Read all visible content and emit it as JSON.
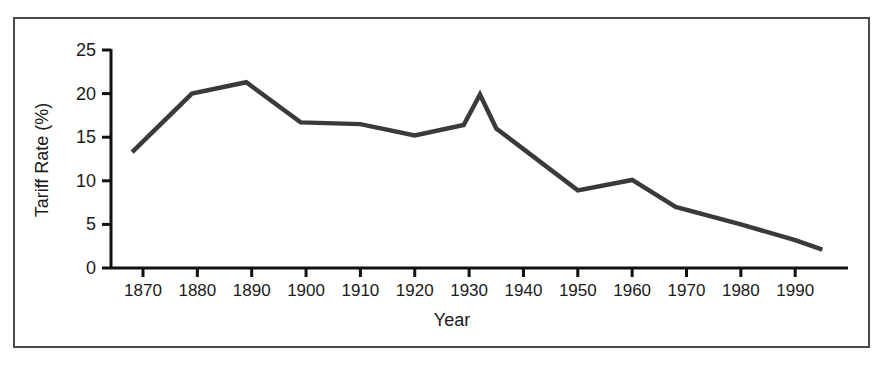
{
  "figure": {
    "frame_border_color": "#4a4a4a",
    "background_color": "#ffffff"
  },
  "chart_data": {
    "type": "line",
    "title": "",
    "xlabel": "Year",
    "ylabel": "Tariff Rate (%)",
    "xlim": [
      1866,
      1996
    ],
    "ylim": [
      0,
      25
    ],
    "xticks": [
      1870,
      1880,
      1890,
      1900,
      1910,
      1920,
      1930,
      1940,
      1950,
      1960,
      1970,
      1980,
      1990
    ],
    "xtick_labels": [
      "1870",
      "1880",
      "1890",
      "1900",
      "1910",
      "1920",
      "1930",
      "1940",
      "1950",
      "1960",
      "1970",
      "1980",
      "1990"
    ],
    "yticks": [
      0,
      5,
      10,
      15,
      20,
      25
    ],
    "ytick_labels": [
      "0",
      "5",
      "10",
      "15",
      "20",
      "25"
    ],
    "grid": false,
    "legend": false,
    "line_color": "#3a3a3a",
    "line_width": 4.5,
    "series": [
      {
        "name": "Tariff Rate",
        "x": [
          1868,
          1879,
          1889,
          1899,
          1910,
          1920,
          1929,
          1932,
          1935,
          1950,
          1960,
          1968,
          1980,
          1990,
          1995
        ],
        "values": [
          13.3,
          20.0,
          21.3,
          16.7,
          16.5,
          15.2,
          16.4,
          19.9,
          16.0,
          8.9,
          10.1,
          7.0,
          5.0,
          3.2,
          2.1
        ]
      }
    ]
  }
}
